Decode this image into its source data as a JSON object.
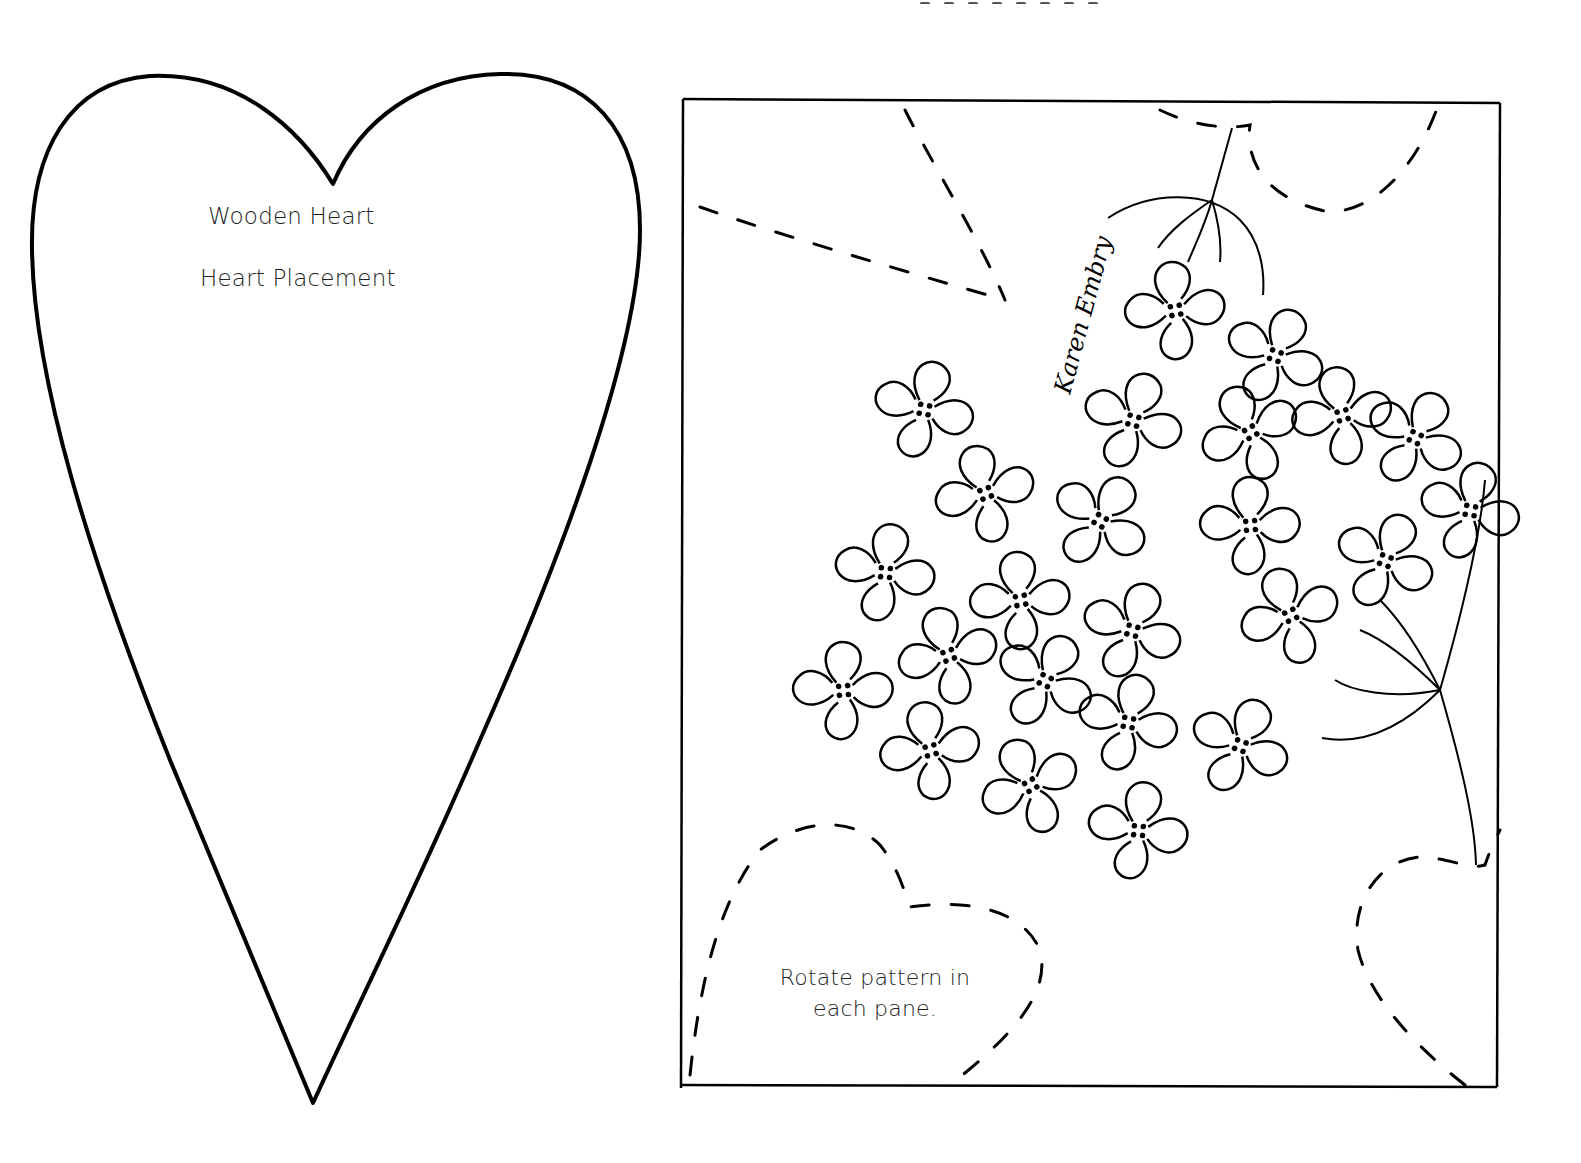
{
  "heart_pattern": {
    "title": "Wooden Heart",
    "subtitle": "Heart Placement",
    "outline_color": "#000000"
  },
  "pane_pattern": {
    "note": "Rotate pattern in each pane.",
    "signature": "Karen Embry",
    "motif": "hydrangea flower cluster with stem",
    "line_color": "#000000",
    "dashed_guides": [
      "top-left leaf",
      "top-right heart",
      "bottom-left heart",
      "bottom-right heart"
    ]
  }
}
